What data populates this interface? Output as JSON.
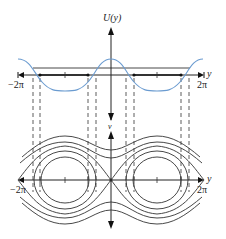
{
  "top_plot": {
    "y_axis_label": "U(y)",
    "x_axis_label": "y",
    "x_min_label": "−2π",
    "x_max_label": "2π",
    "curve_color": "#6a9bd0"
  },
  "bottom_plot": {
    "y_axis_label": "v",
    "x_axis_label": "y",
    "x_min_label": "−2π",
    "x_max_label": "2π",
    "curve_color": "#333333"
  }
}
